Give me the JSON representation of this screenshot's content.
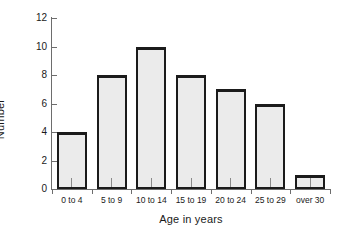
{
  "chart_data": {
    "type": "bar",
    "title": "",
    "subtitle": "",
    "xlabel": "Age in years",
    "ylabel": "Number",
    "categories": [
      "0 to 4",
      "5 to 9",
      "10 to 14",
      "15 to 19",
      "20 to 24",
      "25 to 29",
      "over 30"
    ],
    "values": [
      4,
      8,
      10,
      8,
      7,
      6,
      1
    ],
    "ylim": [
      0,
      12
    ],
    "ytick_values": [
      0,
      2,
      4,
      6,
      8,
      10,
      12
    ],
    "ytick_labels": [
      "0",
      "2",
      "4",
      "6",
      "8",
      "10",
      "12"
    ],
    "grid": false,
    "legend": null,
    "legend_position": "none",
    "annotations": []
  },
  "style": {
    "background": "#ffffff",
    "bar_fill": "#ebebeb",
    "bar_edge": "#1b1b1b",
    "axis_color": "#6d6d6d",
    "text_color": "#1a1a1a"
  }
}
